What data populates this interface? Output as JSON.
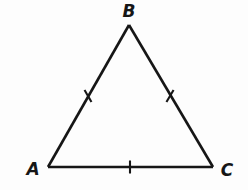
{
  "figure": {
    "name": "triangle-abc",
    "shape_type": "triangle",
    "canvas": {
      "width": 248,
      "height": 190,
      "background_color": "#fdfdfd"
    },
    "stroke": {
      "color": "#161616",
      "width": 2.6,
      "linecap": "round",
      "linejoin": "miter"
    },
    "vertices": [
      {
        "id": "A",
        "label": "A",
        "x": 48,
        "y": 167,
        "label_x": 33,
        "label_y": 175
      },
      {
        "id": "B",
        "label": "B",
        "x": 129,
        "y": 25,
        "label_x": 129,
        "label_y": 17
      },
      {
        "id": "C",
        "label": "C",
        "x": 213,
        "y": 167,
        "label_x": 227,
        "label_y": 176
      }
    ],
    "sides": [
      {
        "id": "AB",
        "from": "A",
        "to": "B",
        "x1": 48,
        "y1": 167,
        "x2": 129,
        "y2": 25
      },
      {
        "id": "BC",
        "from": "B",
        "to": "C",
        "x1": 129,
        "y1": 25,
        "x2": 213,
        "y2": 167
      },
      {
        "id": "AC",
        "from": "A",
        "to": "C",
        "x1": 48,
        "y1": 167,
        "x2": 213,
        "y2": 167
      }
    ],
    "tick_marks": [
      {
        "id": "tick-ab",
        "on_side": "AB",
        "count": 1,
        "cx": 88,
        "cy": 96,
        "angle_deg": 60.3,
        "length": 14
      },
      {
        "id": "tick-bc",
        "on_side": "BC",
        "count": 1,
        "cx": 170,
        "cy": 96,
        "angle_deg": 120.6,
        "length": 14
      },
      {
        "id": "tick-ac",
        "on_side": "AC",
        "count": 1,
        "cx": 130,
        "cy": 167,
        "angle_deg": 90,
        "length": 13
      }
    ],
    "label_color": "#161616",
    "label_font_size_px": 17
  }
}
